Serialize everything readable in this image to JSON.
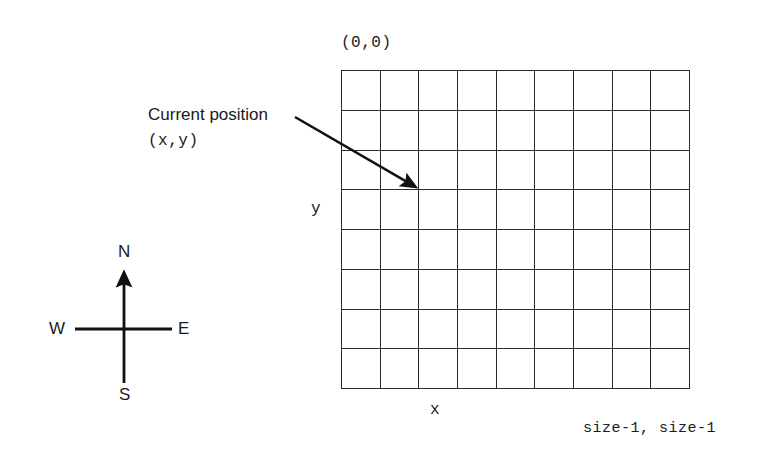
{
  "diagram": {
    "stroke_color": "#2b2b2b",
    "text_color": "#1a1a1a",
    "background_color": "#ffffff"
  },
  "grid": {
    "columns": 9,
    "rows": 8,
    "origin_label": "(0,0)",
    "far_corner_label": "size-1, size-1",
    "axis_x_label": "x",
    "axis_y_label": "y"
  },
  "annotation": {
    "title": "Current position",
    "coordinates": "(x,y)",
    "arrow": {
      "from_x": 295,
      "from_y": 117,
      "to_x": 419,
      "to_y": 189
    }
  },
  "compass": {
    "north": "N",
    "south": "S",
    "west": "W",
    "east": "E"
  },
  "chart_data": {
    "type": "table",
    "xlabel": "x",
    "ylabel": "y",
    "categories": [
      "columns",
      "rows"
    ],
    "values": [
      9,
      8
    ],
    "annotations": [
      "(0,0)",
      "size-1, size-1",
      "Current position",
      "(x,y)",
      "N",
      "S",
      "E",
      "W"
    ]
  }
}
